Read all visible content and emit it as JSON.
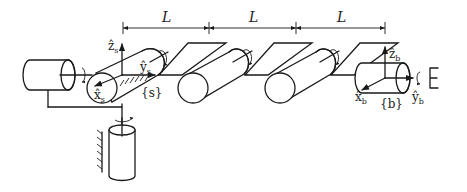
{
  "diagram": {
    "type": "robot-arm-kinematic-sketch",
    "dimension_labels": [
      "L",
      "L",
      "L"
    ],
    "frames": {
      "space": {
        "label": "{s}",
        "axes": {
          "x": "x̂",
          "x_sub": "s",
          "y": "ŷ",
          "y_sub": "s",
          "z": "ẑ",
          "z_sub": "s"
        }
      },
      "body": {
        "label": "{b}",
        "axes": {
          "x": "x̂",
          "x_sub": "b",
          "y": "ŷ",
          "y_sub": "b",
          "z": "ẑ",
          "z_sub": "b"
        }
      }
    },
    "joints": [
      "base-revolute-vertical",
      "shoulder-revolute-horizontal",
      "revolute-1",
      "revolute-2",
      "revolute-3",
      "wrist-revolute"
    ],
    "colors": {
      "stroke": "#1a1a1a",
      "background": "#ffffff"
    }
  }
}
